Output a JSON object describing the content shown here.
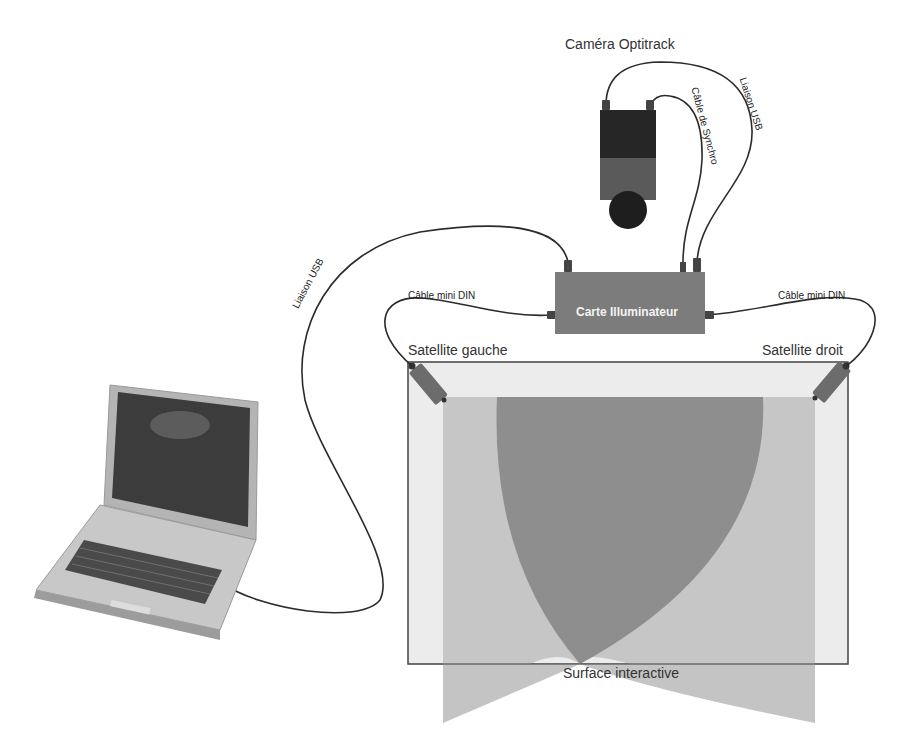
{
  "diagram": {
    "nodes": {
      "camera": {
        "label": "Caméra Optitrack"
      },
      "board": {
        "label": "Carte Illuminateur"
      },
      "satellite_left": {
        "label": "Satellite gauche"
      },
      "satellite_right": {
        "label": "Satellite droit"
      },
      "surface": {
        "label": "Surface interactive"
      },
      "laptop": {
        "label": ""
      }
    },
    "edges": {
      "laptop_to_board": {
        "label": "Liaison USB"
      },
      "camera_to_board_usb": {
        "label": "Liaison USB"
      },
      "camera_to_board_sync": {
        "label": "Câble de Synchro"
      },
      "board_to_left_satellite": {
        "label": "Câble mini  DIN"
      },
      "board_to_right_satellite": {
        "label": "Câble mini  DIN"
      }
    }
  },
  "colors": {
    "background": "#ffffff",
    "board_fill": "#7c7c7c",
    "camera_body_top": "#2a2a2a",
    "camera_body_bottom": "#5a5a5a",
    "camera_lens": "#1e1e1e",
    "satellite_fill": "#6e6e6e",
    "surface_fill": "#ebebeb",
    "beam_light": "#c6c6c6",
    "beam_overlap": "#8f8f8f",
    "cable": "#2b2b2b"
  }
}
